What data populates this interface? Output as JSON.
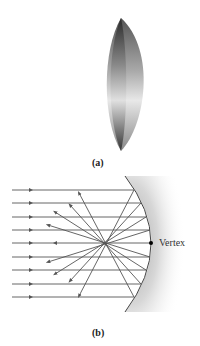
{
  "figure": {
    "panel_a": {
      "label": "(a)",
      "subject": "spherical-mirror-segment"
    },
    "panel_b": {
      "label": "(b)",
      "subject": "concave-mirror-ray-diagram",
      "incoming_ray_count": 9,
      "vertex_label": "Vertex"
    }
  },
  "colors": {
    "ray": "#555555",
    "mirror_edge": "#444444",
    "mirror_shadow": "#b0b0b0",
    "lens_dark": "#2a2a2a",
    "lens_light": "#d8d8d8",
    "vertex_dot": "#000000"
  }
}
